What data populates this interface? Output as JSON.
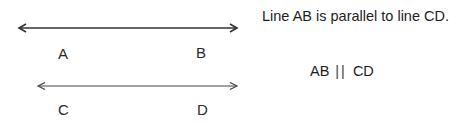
{
  "diagram": {
    "lines": [
      {
        "name": "AB",
        "x1": 19,
        "x2": 237,
        "y": 28,
        "arrows": "both",
        "labels": [
          "A",
          "B"
        ]
      },
      {
        "name": "CD",
        "x1": 38,
        "x2": 237,
        "y": 86,
        "arrows": "both",
        "labels": [
          "C",
          "D"
        ]
      }
    ],
    "labels": {
      "A": "A",
      "B": "B",
      "C": "C",
      "D": "D"
    },
    "statement": "Line AB is parallel to line CD.",
    "notation": {
      "left": "AB",
      "symbol": "||",
      "right": "CD"
    },
    "colors": {
      "line": "#333333",
      "text": "#1e1e1e",
      "background": "#ffffff"
    }
  }
}
